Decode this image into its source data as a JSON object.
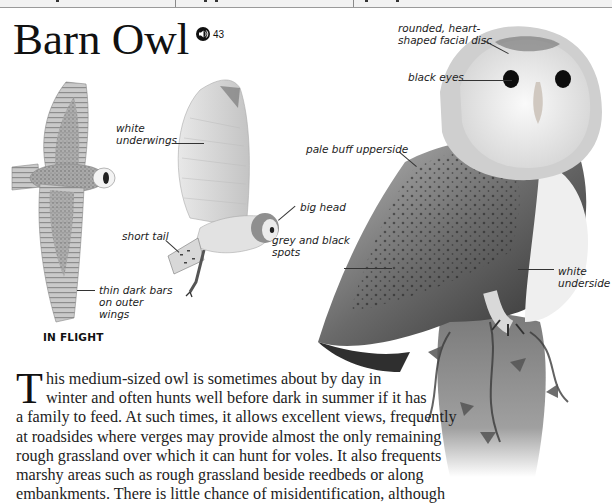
{
  "page": {
    "title": "Barn Owl",
    "audio": {
      "icon": "speaker-icon",
      "track_number": "43"
    },
    "top_strip": {
      "dividers_x": [
        175,
        353
      ]
    },
    "illustrations": {
      "flight_top_view": {
        "description": "barn owl in flight seen from above"
      },
      "flight_side_view": {
        "description": "barn owl in flight seen from side, wing raised"
      },
      "perched_photo": {
        "description": "barn owl perched on ivy-covered post"
      }
    },
    "flight_caption": "IN FLIGHT",
    "annotations": [
      {
        "id": "white-underwings",
        "text": "white\nunderwings"
      },
      {
        "id": "short-tail",
        "text": "short tail"
      },
      {
        "id": "thin-dark-bars",
        "text": "thin dark bars\non outer\nwings"
      },
      {
        "id": "big-head",
        "text": "big head"
      },
      {
        "id": "facial-disc",
        "text": "rounded, heart-\nshaped facial disc"
      },
      {
        "id": "black-eyes",
        "text": "black eyes"
      },
      {
        "id": "pale-buff-upperside",
        "text": "pale buff upperside"
      },
      {
        "id": "grey-black-spots",
        "text": "grey and black\nspots"
      },
      {
        "id": "white-underside",
        "text": "white\nunderside"
      }
    ],
    "body": {
      "drop_cap": "T",
      "lines": [
        "his medium-sized owl is sometimes about by day in",
        "winter and often hunts well before dark in summer if it has",
        "a family to feed. At such times, it allows excellent views, frequently",
        "at roadsides where verges may provide almost the only remaining",
        "rough grassland over which it can hunt for voles. It also frequents",
        "marshy areas such as rough grassland beside reedbeds or along",
        "embankments. There is little chance of misidentification, although"
      ]
    }
  }
}
